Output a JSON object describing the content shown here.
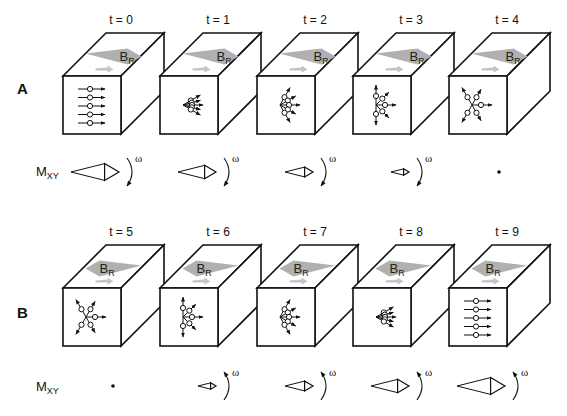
{
  "rows": [
    {
      "label": "A",
      "magnetization_label": "M",
      "magnetization_sub": "XY",
      "field_label": "B",
      "field_sub": "R",
      "field_direction": "right",
      "rotation_direction": "clockwise",
      "omega": "ω",
      "frames": [
        {
          "t": "t = 0",
          "spread_deg": 0,
          "mxy_len": 48,
          "has_rotation": true
        },
        {
          "t": "t = 1",
          "spread_deg": 60,
          "mxy_len": 38,
          "has_rotation": true
        },
        {
          "t": "t = 2",
          "spread_deg": 120,
          "mxy_len": 28,
          "has_rotation": true
        },
        {
          "t": "t = 3",
          "spread_deg": 180,
          "mxy_len": 18,
          "has_rotation": true
        },
        {
          "t": "t = 4",
          "spread_deg": 240,
          "mxy_len": 0,
          "has_rotation": false
        }
      ]
    },
    {
      "label": "B",
      "magnetization_label": "M",
      "magnetization_sub": "XY",
      "field_label": "B",
      "field_sub": "R",
      "field_direction": "left",
      "rotation_direction": "counterclockwise",
      "omega": "ω",
      "frames": [
        {
          "t": "t = 5",
          "spread_deg": 240,
          "mxy_len": 0,
          "has_rotation": false
        },
        {
          "t": "t = 6",
          "spread_deg": 180,
          "mxy_len": 18,
          "has_rotation": true
        },
        {
          "t": "t = 7",
          "spread_deg": 120,
          "mxy_len": 28,
          "has_rotation": true
        },
        {
          "t": "t = 8",
          "spread_deg": 60,
          "mxy_len": 38,
          "has_rotation": true
        },
        {
          "t": "t = 9",
          "spread_deg": 0,
          "mxy_len": 48,
          "has_rotation": true
        }
      ]
    }
  ],
  "colors": {
    "line": "#111111",
    "field_arrow": "#b0b0b0",
    "small_arrow": "#c4c4c4"
  }
}
